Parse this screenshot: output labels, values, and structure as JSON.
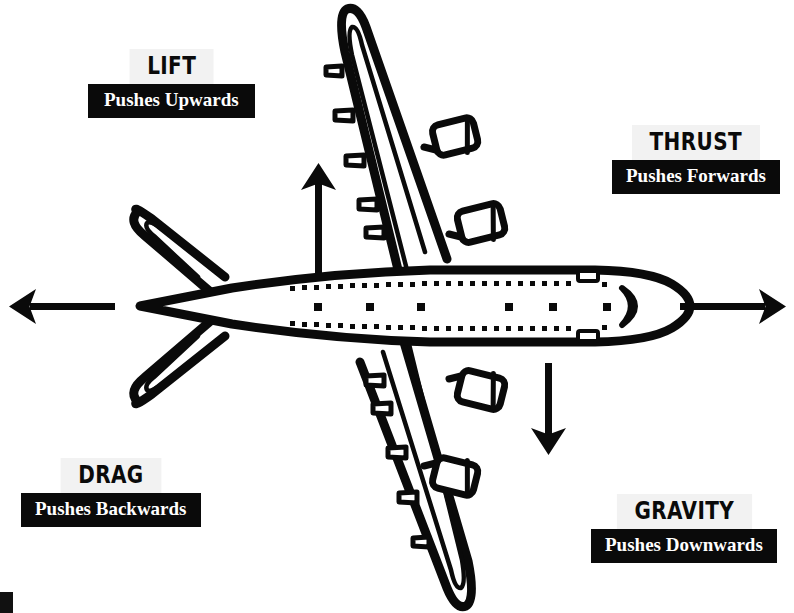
{
  "diagram": {
    "background_color": "#ffffff",
    "ink_color": "#0a0a0a",
    "label_title_background": "#f2f2f2",
    "label_sub_background": "#0a0a0a",
    "label_sub_text_color": "#ffffff"
  },
  "forces": [
    {
      "id": "lift",
      "title": "LIFT",
      "subtitle": "Pushes Upwards",
      "arrow_direction": "up",
      "arrow_name": "lift-arrow-up"
    },
    {
      "id": "thrust",
      "title": "THRUST",
      "subtitle": "Pushes Forwards",
      "arrow_direction": "right",
      "arrow_name": "thrust-arrow-right"
    },
    {
      "id": "drag",
      "title": "DRAG",
      "subtitle": "Pushes Backwards",
      "arrow_direction": "left",
      "arrow_name": "drag-arrow-left"
    },
    {
      "id": "gravity",
      "title": "GRAVITY",
      "subtitle": "Pushes Downwards",
      "arrow_direction": "down",
      "arrow_name": "gravity-arrow-down"
    }
  ],
  "aircraft": {
    "view": "top-down",
    "parts": [
      "fuselage",
      "nose-cockpit-window",
      "upper-wing",
      "lower-wing",
      "upper-engine-inboard",
      "upper-engine-outboard",
      "lower-engine-inboard",
      "lower-engine-outboard",
      "upper-horizontal-stabilizer",
      "lower-horizontal-stabilizer",
      "window-row-upper",
      "window-row-lower",
      "door-markings"
    ],
    "engine_count": 4,
    "window_rows": 2,
    "door_count": 6
  }
}
